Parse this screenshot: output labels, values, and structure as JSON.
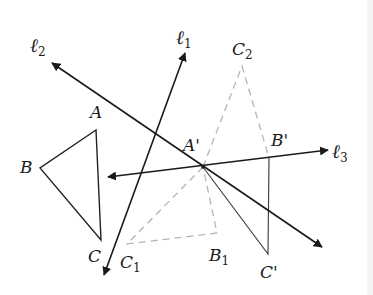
{
  "figure": {
    "lines": [
      {
        "id": "l1",
        "label": "ℓ",
        "subscript": "1",
        "from": [
          104,
          275
        ],
        "to": [
          185,
          53
        ],
        "label_pos": [
          176,
          44
        ]
      },
      {
        "id": "l2",
        "label": "ℓ",
        "subscript": "2",
        "from": [
          322,
          247
        ],
        "to": [
          52,
          63
        ],
        "label_pos": [
          30,
          52
        ]
      },
      {
        "id": "l3",
        "label": "ℓ",
        "subscript": "3",
        "from": [
          108,
          177
        ],
        "to": [
          328,
          150
        ],
        "label_pos": [
          332,
          158
        ]
      }
    ],
    "triangles": {
      "original": {
        "style": "solid",
        "vertices": {
          "A": {
            "pt": [
              96,
              130
            ],
            "label": "A",
            "label_pos": [
              90,
              118
            ]
          },
          "B": {
            "pt": [
              40,
              168
            ],
            "label": "B",
            "label_pos": [
              20,
              173
            ]
          },
          "C": {
            "pt": [
              101,
              240
            ],
            "label": "C",
            "label_pos": [
              88,
              262
            ]
          }
        }
      },
      "image1": {
        "style": "dashed",
        "vertices": {
          "A1": {
            "pt": [
              203,
              167
            ]
          },
          "B1": {
            "pt": [
              217,
              233
            ],
            "label": "B",
            "subscript": "1",
            "label_pos": [
              209,
              261
            ]
          },
          "C1": {
            "pt": [
              127,
              244
            ],
            "label": "C",
            "subscript": "1",
            "label_pos": [
              120,
              268
            ]
          }
        }
      },
      "image2": {
        "style": "dashed",
        "vertices": {
          "A2": {
            "pt": [
              203,
              167
            ]
          },
          "B2": {
            "pt": [
              269,
              158
            ]
          },
          "C2": {
            "pt": [
              242,
              66
            ],
            "label": "C",
            "subscript": "2",
            "label_pos": [
              232,
              55
            ]
          }
        }
      },
      "final": {
        "style": "solid",
        "vertices": {
          "A'": {
            "pt": [
              203,
              167
            ],
            "label": "A'",
            "label_pos": [
              183,
              151
            ]
          },
          "B'": {
            "pt": [
              269,
              158
            ],
            "label": "B'",
            "label_pos": [
              271,
              146
            ]
          },
          "C'": {
            "pt": [
              268,
              254
            ],
            "label": "C'",
            "label_pos": [
              260,
              278
            ]
          }
        }
      }
    },
    "colors": {
      "ink": "#1a1a1a",
      "dashed": "#b5b5b5",
      "background": "#ffffff"
    }
  },
  "labels": {
    "A": "A",
    "B": "B",
    "C": "C",
    "A_prime": "A'",
    "B_prime": "B'",
    "C_prime": "C'",
    "C1": "C",
    "C1_sub": "1",
    "B1": "B",
    "B1_sub": "1",
    "C2": "C",
    "C2_sub": "2",
    "ell": "ℓ",
    "l1_sub": "1",
    "l2_sub": "2",
    "l3_sub": "3"
  }
}
